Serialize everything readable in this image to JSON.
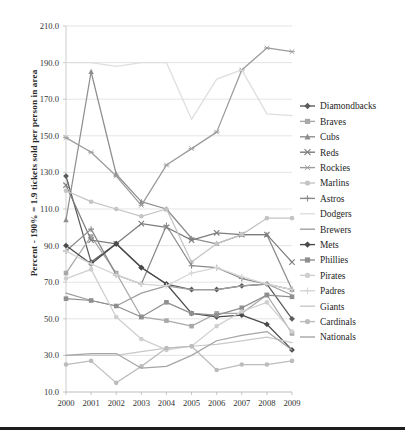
{
  "chart_data": {
    "type": "line",
    "title": "",
    "xlabel": "",
    "ylabel": "Percent - 190% = 1.9 tickets sold per person in area",
    "categories": [
      "2000",
      "2001",
      "2002",
      "2003",
      "2004",
      "2005",
      "2006",
      "2007",
      "2008",
      "2009"
    ],
    "xlim": [
      2000,
      2009
    ],
    "ylim": [
      10.0,
      210.0
    ],
    "ytick_labels": [
      "10.0",
      "30.0",
      "50.0",
      "70.0",
      "90.0",
      "110.0",
      "130.0",
      "150.0",
      "170.0",
      "190.0",
      "210.0"
    ],
    "yticks": [
      10,
      30,
      50,
      70,
      90,
      110,
      130,
      150,
      170,
      190,
      210
    ],
    "grid": "horizontal",
    "legend_position": "right",
    "series": [
      {
        "name": "Diamondbacks",
        "marker": "diamond",
        "color": "#5b5b5b",
        "values": [
          128,
          81,
          91,
          78,
          69,
          66,
          66,
          68,
          69,
          50
        ]
      },
      {
        "name": "Braves",
        "marker": "square",
        "color": "#a8a8a8",
        "values": [
          75,
          95,
          75,
          51,
          49,
          46,
          53,
          53,
          63,
          42
        ]
      },
      {
        "name": "Cubs",
        "marker": "triangle",
        "color": "#8e8e8e",
        "values": [
          104,
          185,
          129,
          114,
          110,
          94,
          91,
          96,
          96,
          66
        ]
      },
      {
        "name": "Reds",
        "marker": "cross",
        "color": "#7d7d7d",
        "values": [
          123,
          93,
          91,
          102,
          100,
          93,
          97,
          96,
          96,
          81
        ]
      },
      {
        "name": "Rockies",
        "marker": "star",
        "color": "#9b9b9b",
        "values": [
          149,
          141,
          128,
          112,
          134,
          143,
          152,
          186,
          198,
          196
        ]
      },
      {
        "name": "Marlins",
        "marker": "circle",
        "color": "#c4c4c4",
        "values": [
          120,
          114,
          110,
          106,
          110,
          81,
          91,
          96,
          105,
          105
        ]
      },
      {
        "name": "Astros",
        "marker": "plus",
        "color": "#8a8a8a",
        "values": [
          87,
          99,
          74,
          69,
          101,
          79,
          78,
          72,
          69,
          66
        ]
      },
      {
        "name": "Dodgers",
        "marker": "none",
        "color": "#dedede",
        "values": [
          190,
          190,
          188,
          190,
          190,
          159,
          181,
          186,
          162,
          161
        ]
      },
      {
        "name": "Brewers",
        "marker": "none",
        "color": "#9f9f9f",
        "values": [
          64,
          60,
          57,
          64,
          68,
          66,
          66,
          68,
          69,
          63
        ]
      },
      {
        "name": "Mets",
        "marker": "diamond",
        "color": "#4a4a4a",
        "values": [
          90,
          80,
          91,
          78,
          69,
          53,
          51,
          52,
          47,
          33
        ]
      },
      {
        "name": "Phillies",
        "marker": "square",
        "color": "#8f8f8f",
        "values": [
          61,
          60,
          57,
          51,
          59,
          53,
          52,
          56,
          63,
          62
        ]
      },
      {
        "name": "Pirates",
        "marker": "circle",
        "color": "#cfcfcf",
        "values": [
          72,
          77,
          51,
          39,
          33,
          35,
          46,
          54,
          59,
          43
        ]
      },
      {
        "name": "Padres",
        "marker": "plus",
        "color": "#d6d6d6",
        "values": [
          87,
          80,
          74,
          69,
          68,
          75,
          78,
          73,
          69,
          66
        ]
      },
      {
        "name": "Giants",
        "marker": "none",
        "color": "#c9c9c9",
        "values": [
          30,
          30,
          30,
          32,
          34,
          35,
          36,
          38,
          40,
          37
        ]
      },
      {
        "name": "Cardinals",
        "marker": "circle",
        "color": "#bcbcbc",
        "values": [
          25,
          27,
          15,
          24,
          34,
          35,
          22,
          25,
          25,
          27
        ]
      },
      {
        "name": "Nationals",
        "marker": "none",
        "color": "#a5a5a5",
        "values": [
          30,
          31,
          31,
          23,
          24,
          30,
          38,
          41,
          43,
          33
        ]
      }
    ]
  },
  "legend": {
    "items": [
      {
        "label": "Diamondbacks"
      },
      {
        "label": "Braves"
      },
      {
        "label": "Cubs"
      },
      {
        "label": "Reds"
      },
      {
        "label": "Rockies"
      },
      {
        "label": "Marlins"
      },
      {
        "label": "Astros"
      },
      {
        "label": "Dodgers"
      },
      {
        "label": "Brewers"
      },
      {
        "label": "Mets"
      },
      {
        "label": "Phillies"
      },
      {
        "label": "Pirates"
      },
      {
        "label": "Padres"
      },
      {
        "label": "Giants"
      },
      {
        "label": "Cardinals"
      },
      {
        "label": "Nationals"
      }
    ]
  }
}
